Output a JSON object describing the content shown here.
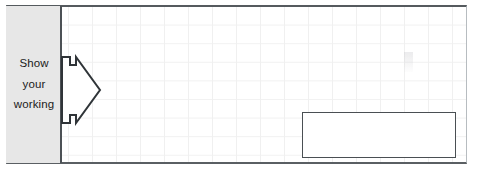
{
  "worksheet": {
    "instruction_panel": {
      "lines": [
        "Show",
        "your",
        "working"
      ]
    },
    "arrow": {
      "icon": "block-arrow-right-icon",
      "direction": "right"
    },
    "answer_box": {
      "value": "",
      "placeholder": ""
    },
    "colors": {
      "panel_background": "#e7e7e7",
      "frame_border": "#555a5e",
      "grid_line": "#f0f0f0",
      "answer_box_border": "#4a4f53",
      "text": "#1b1b1b",
      "page_background": "#ffffff"
    }
  }
}
